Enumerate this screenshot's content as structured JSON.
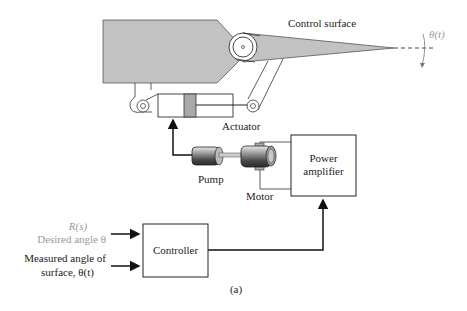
{
  "diagram": {
    "labels": {
      "control_surface": "Control surface",
      "theta_t": "θ(t)",
      "actuator": "Actuator",
      "pump": "Pump",
      "motor": "Motor",
      "power_amplifier_line1": "Power",
      "power_amplifier_line2": "amplifier",
      "controller": "Controller",
      "reference_symbol": "R(s)",
      "desired_angle": "Desired angle θ",
      "measured_line1": "Measured angle of",
      "measured_line2": "surface, θ(t)",
      "caption": "(a)"
    },
    "colors": {
      "wing_fill": "#c2c2c2",
      "stroke": "#222222",
      "reference_text": "#9a9a9a",
      "piston_fill": "#a8a8a8"
    }
  }
}
